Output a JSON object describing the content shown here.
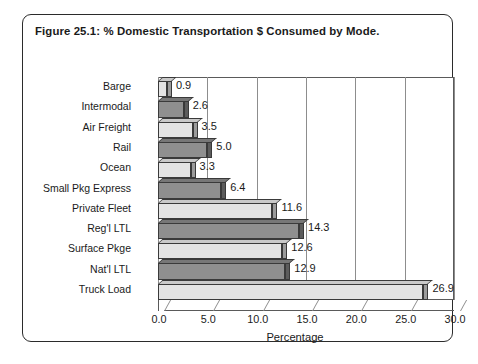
{
  "figure": {
    "title": "Figure 25.1: % Domestic Transportation $ Consumed by Mode."
  },
  "chart_data": {
    "type": "bar",
    "orientation": "horizontal",
    "title": "Figure 25.1: % Domestic Transportation $ Consumed by Mode.",
    "xlabel": "Percentage",
    "ylabel": "",
    "xlim": [
      0.0,
      30.0
    ],
    "xticks": [
      "0.0",
      "5.0",
      "10.0",
      "15.0",
      "20.0",
      "25.0",
      "30.0"
    ],
    "xtick_values": [
      0,
      5,
      10,
      15,
      20,
      25,
      30
    ],
    "grid": true,
    "legend": false,
    "categories": [
      "Barge",
      "Intermodal",
      "Air Freight",
      "Rail",
      "Ocean",
      "Small Pkg Express",
      "Private Fleet",
      "Reg'l LTL",
      "Surface Pkge",
      "Nat'l LTL",
      "Truck Load"
    ],
    "values": [
      0.9,
      2.6,
      3.5,
      5.0,
      3.3,
      6.4,
      11.6,
      14.3,
      12.6,
      12.9,
      26.9
    ],
    "data_labels": [
      "0.9",
      "2.6",
      "3.5",
      "5.0",
      "3.3",
      "6.4",
      "11.6",
      "14.3",
      "12.6",
      "12.9",
      "26.9"
    ],
    "bar_styles": [
      "light",
      "dark",
      "light",
      "dark",
      "light",
      "dark",
      "light",
      "dark",
      "light",
      "dark",
      "light"
    ],
    "colors": {
      "bar_light": "#e3e3e3",
      "bar_dark": "#8f8f8f",
      "outline": "#3a3a3a",
      "gridline": "#8d8d8d",
      "text": "#1a1a1a",
      "border": "#2b2b2b"
    }
  }
}
